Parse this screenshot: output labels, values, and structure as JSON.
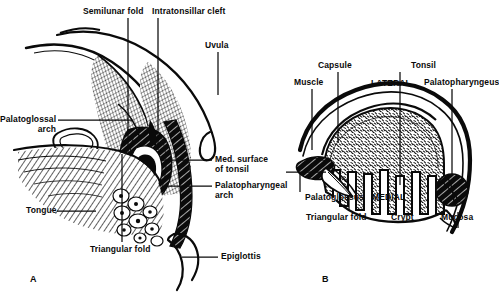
{
  "figure": {
    "ink_color": "#0a0a0a",
    "background": "#ffffff"
  },
  "panels": [
    {
      "id": "A",
      "id_label": "A",
      "name": "sagittal-view",
      "labels": [
        {
          "key": "semilunar_fold",
          "text": "Semilunar fold",
          "x": 83,
          "y": 7,
          "align": "left"
        },
        {
          "key": "intratonsillar_cleft",
          "text": "Intratonsillar cleft",
          "x": 152,
          "y": 7,
          "align": "left"
        },
        {
          "key": "uvula",
          "text": "Uvula",
          "x": 205,
          "y": 41,
          "align": "left"
        },
        {
          "key": "palatoglossal_arch",
          "text": "Palatoglossal\narch",
          "x": 4,
          "y": 115,
          "align": "right"
        },
        {
          "key": "med_surface_of_tonsil",
          "text": "Med. surface\nof tonsil",
          "x": 215,
          "y": 155,
          "align": "left"
        },
        {
          "key": "palatopharyngeal_arch",
          "text": "Palatopharyngeal\narch",
          "x": 215,
          "y": 180,
          "align": "left"
        },
        {
          "key": "tongue",
          "text": "Tongue",
          "x": 26,
          "y": 208,
          "align": "left"
        },
        {
          "key": "triangular_fold",
          "text": "Triangular fold",
          "x": 90,
          "y": 246,
          "align": "left"
        },
        {
          "key": "epiglottis",
          "text": "Epiglottis",
          "x": 221,
          "y": 252,
          "align": "left"
        }
      ]
    },
    {
      "id": "B",
      "id_label": "B",
      "name": "cross-section-view",
      "labels": [
        {
          "key": "capsule",
          "text": "Capsule",
          "x": 324,
          "y": 61,
          "align": "left"
        },
        {
          "key": "muscle",
          "text": "Muscle",
          "x": 300,
          "y": 78,
          "align": "left"
        },
        {
          "key": "lateral",
          "text": "LATERAL",
          "x": 374,
          "y": 79,
          "align": "left"
        },
        {
          "key": "tonsil",
          "text": "Tonsil",
          "x": 414,
          "y": 61,
          "align": "left"
        },
        {
          "key": "palatopharyngeus",
          "text": "Palatopharyngeus",
          "x": 428,
          "y": 78,
          "align": "left"
        },
        {
          "key": "palatoglossus",
          "text": "Palatoglossus",
          "x": 308,
          "y": 196,
          "align": "left"
        },
        {
          "key": "medial",
          "text": "MEDIAL",
          "x": 374,
          "y": 196,
          "align": "left"
        },
        {
          "key": "triangular_fold_b",
          "text": "Triangular fold",
          "x": 310,
          "y": 215,
          "align": "left"
        },
        {
          "key": "crypt",
          "text": "Crypt",
          "x": 398,
          "y": 215,
          "align": "left"
        },
        {
          "key": "mucosa",
          "text": "Mucosa",
          "x": 440,
          "y": 215,
          "align": "left"
        }
      ]
    }
  ]
}
